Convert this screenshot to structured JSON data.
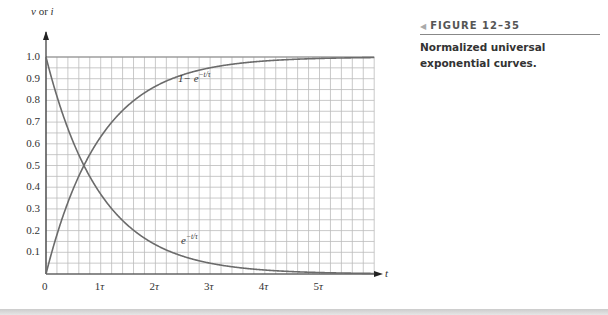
{
  "figure": {
    "number_label": "FIGURE 12–35",
    "caption": "Normalized universal exponential curves."
  },
  "chart_data": {
    "type": "line",
    "title": "Normalized universal exponential curves.",
    "xlabel": "t",
    "ylabel": "v or i",
    "x_ticks": [
      "0",
      "1τ",
      "2τ",
      "3τ",
      "4τ",
      "5τ"
    ],
    "y_ticks": [
      "0.1",
      "0.2",
      "0.3",
      "0.4",
      "0.5",
      "0.6",
      "0.7",
      "0.8",
      "0.9",
      "1.0"
    ],
    "xlim": [
      0,
      6
    ],
    "ylim": [
      0,
      1.0
    ],
    "grid": true,
    "x": [
      0,
      0.5,
      1,
      1.5,
      2,
      2.5,
      3,
      3.5,
      4,
      4.5,
      5,
      5.5,
      6
    ],
    "series": [
      {
        "name": "1 − e^(−t/τ)",
        "values": [
          0,
          0.393,
          0.632,
          0.777,
          0.865,
          0.918,
          0.95,
          0.97,
          0.982,
          0.989,
          0.993,
          0.996,
          0.998
        ]
      },
      {
        "name": "e^(−t/τ)",
        "values": [
          1.0,
          0.607,
          0.368,
          0.223,
          0.135,
          0.082,
          0.05,
          0.03,
          0.018,
          0.011,
          0.007,
          0.004,
          0.002
        ]
      }
    ],
    "annotations": [
      {
        "text": "1− e^(−t/τ)",
        "near": "rising curve"
      },
      {
        "text": "e^(−t/τ)",
        "near": "decaying curve"
      }
    ]
  },
  "labels": {
    "ylabel_v": "v",
    "ylabel_or": " or ",
    "ylabel_i": "i",
    "xlabel": "t",
    "rise_base": "1− e",
    "rise_exp": "−t/τ",
    "decay_base": "e",
    "decay_exp": "−t/τ"
  }
}
